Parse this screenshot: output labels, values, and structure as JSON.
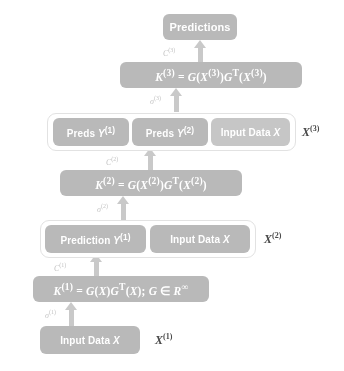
{
  "diagram": {
    "colors": {
      "node_fill": "#b9b9b9",
      "node_fill_light": "#c6c6c6",
      "node_text": "#ffffff",
      "arrow": "#c9c9c9",
      "annotation_text": "#c4c4c4",
      "layer_label_text": "#4a4a4a",
      "group_border": "#e2e2e2",
      "background": "#ffffff"
    },
    "nodes": {
      "predictions": "Predictions",
      "kernel_3": "K(3) = G(X(3))GT(X(3))",
      "preds_y1": "Preds Y(1)",
      "preds_y2": "Preds Y(2)",
      "input_data_x_layer3": "Input Data X",
      "kernel_2": "K(2) = G(X(2))GT(X(2))",
      "prediction_y1": "Prediction Y(1)",
      "input_data_x_layer2": "Input Data X",
      "kernel_1": "K(1) = G(X)GT(X); G ∈ R∞",
      "input_data_x_layer1": "Input Data X"
    },
    "layer_labels": {
      "layer3": "X(3)",
      "layer2": "X(2)",
      "layer1": "X(1)"
    },
    "annotations": {
      "c3": "C(3)",
      "sigma3": "σ(3)",
      "c2": "C(2)",
      "sigma2": "σ(2)",
      "c1": "C(1)",
      "sigma1": "σ(1)"
    }
  }
}
